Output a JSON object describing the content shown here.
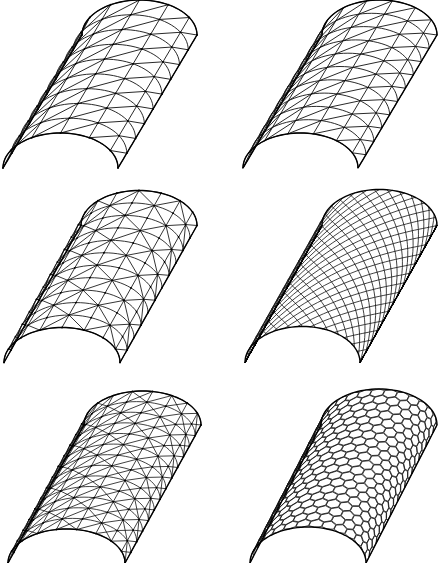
{
  "figure": {
    "width": 443,
    "height": 563,
    "line_color": "#111111",
    "background": "#ffffff",
    "panels": [
      {
        "id": "vault-1",
        "pattern": "triangulated-diagonal",
        "front_left": [
          3,
          168
        ],
        "front_right": [
          118,
          168
        ],
        "rise": 35,
        "length_vector": [
          79,
          -133
        ],
        "arch_divisions": 6,
        "length_divisions": 9,
        "stroke_width": 0.9,
        "nodes": true
      },
      {
        "id": "vault-2",
        "pattern": "triangulated-diagonal",
        "front_left": [
          243,
          168
        ],
        "front_right": [
          358,
          168
        ],
        "rise": 35,
        "length_vector": [
          79,
          -133
        ],
        "arch_divisions": 7,
        "length_divisions": 10,
        "stroke_width": 0.9,
        "nodes": false
      },
      {
        "id": "vault-3",
        "pattern": "triangulated-alternating",
        "front_left": [
          4,
          363
        ],
        "front_right": [
          120,
          362
        ],
        "rise": 35,
        "length_vector": [
          77,
          -137
        ],
        "arch_divisions": 8,
        "length_divisions": 11,
        "stroke_width": 0.85,
        "nodes": true
      },
      {
        "id": "vault-4",
        "pattern": "diamond-lattice",
        "front_left": [
          245,
          362
        ],
        "front_right": [
          360,
          363
        ],
        "rise": 36,
        "length_vector": [
          77,
          -137
        ],
        "arch_divisions": 14,
        "length_divisions": 18,
        "stroke_width": 0.8,
        "nodes": false
      },
      {
        "id": "vault-5",
        "pattern": "triangulated-three-way",
        "front_left": [
          8,
          563
        ],
        "front_right": [
          125,
          563
        ],
        "rise": 34,
        "length_vector": [
          76,
          -138
        ],
        "arch_divisions": 9,
        "length_divisions": 13,
        "stroke_width": 0.8,
        "nodes": true
      },
      {
        "id": "vault-6",
        "pattern": "hexagonal",
        "front_left": [
          250,
          563
        ],
        "front_right": [
          366,
          563
        ],
        "rise": 36,
        "length_vector": [
          71,
          -138
        ],
        "arch_divisions": 14,
        "length_divisions": 20,
        "stroke_width": 0.8,
        "nodes": false
      }
    ]
  }
}
